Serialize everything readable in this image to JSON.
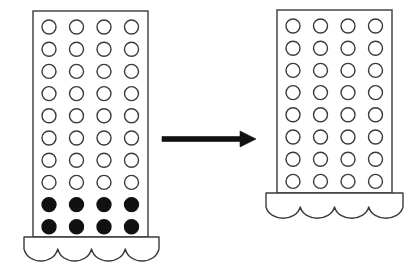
{
  "diagram": {
    "canvas": {
      "width": 420,
      "height": 275,
      "background": "#ffffff"
    },
    "style": {
      "outline_color": "#3a3a3a",
      "fill_color": "#ffffff",
      "filled_circle_color": "#111111",
      "arrow_color": "#111111",
      "stroke_width": 1.4,
      "circle_stroke_width": 1.4
    },
    "left_assembly": {
      "name": "left-container",
      "body": {
        "x": 33,
        "y": 11,
        "width": 115,
        "height": 226
      },
      "grid": {
        "rows": 10,
        "columns": 4,
        "circle_radius": 7,
        "first_center_x": 49,
        "first_center_y": 27,
        "step_x": 27.5,
        "step_y": 22.2,
        "open_rows": 8,
        "filled_rows": 2,
        "row_states": [
          "open",
          "open",
          "open",
          "open",
          "open",
          "open",
          "open",
          "open",
          "filled",
          "filled"
        ]
      },
      "base": {
        "name": "left-base",
        "x": 24,
        "y": 237,
        "width": 135,
        "straight_height": 12,
        "scallops": 4,
        "scallop_depth": 16
      }
    },
    "arrow": {
      "name": "transfer-arrow",
      "x1": 162,
      "x2": 256,
      "y": 139,
      "shaft_thickness": 5,
      "head_length": 16,
      "head_half_height": 8,
      "direction": "right"
    },
    "right_assembly": {
      "name": "right-container",
      "body": {
        "x": 277,
        "y": 10,
        "width": 115,
        "height": 183
      },
      "grid": {
        "rows": 8,
        "columns": 4,
        "circle_radius": 7,
        "first_center_x": 293,
        "first_center_y": 26,
        "step_x": 27.5,
        "step_y": 22.2,
        "open_rows": 8,
        "filled_rows": 0,
        "row_states": [
          "open",
          "open",
          "open",
          "open",
          "open",
          "open",
          "open",
          "open"
        ]
      },
      "base": {
        "name": "right-base",
        "x": 266,
        "y": 193,
        "width": 137,
        "straight_height": 14,
        "scallops": 4,
        "scallop_depth": 15
      }
    }
  }
}
